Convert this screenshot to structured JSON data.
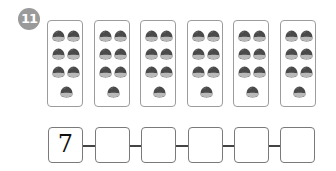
{
  "problem": {
    "number": "11",
    "badge_color": "#9a9a9a"
  },
  "cards": [
    {
      "count": 7
    },
    {
      "count": 7
    },
    {
      "count": 7
    },
    {
      "count": 7
    },
    {
      "count": 7
    },
    {
      "count": 7
    }
  ],
  "item_icon": "chestnut-icon",
  "answer_boxes": [
    {
      "value": "7"
    },
    {
      "value": ""
    },
    {
      "value": ""
    },
    {
      "value": ""
    },
    {
      "value": ""
    },
    {
      "value": ""
    }
  ]
}
